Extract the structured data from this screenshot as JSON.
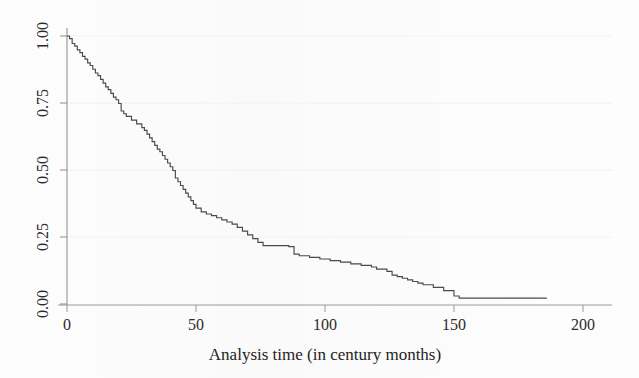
{
  "chart_data": {
    "type": "line",
    "subtype": "kaplan-meier-step",
    "title": "",
    "xlabel": "Analysis time (in century months)",
    "ylabel": "",
    "xlim": [
      -8,
      212
    ],
    "ylim": [
      0.0,
      1.0
    ],
    "xticks": [
      0,
      50,
      100,
      150,
      200
    ],
    "xticklabels": [
      "0",
      "50",
      "100",
      "150",
      "200"
    ],
    "yticks": [
      0.0,
      0.25,
      0.5,
      0.75,
      1.0
    ],
    "yticklabels": [
      "0.00",
      "0.25",
      "0.50",
      "0.75",
      "1.00"
    ],
    "grid": "faint-horizontal",
    "legend": "none",
    "line_color": "#4a4a4a",
    "series": [
      {
        "name": "Survivor function",
        "step": "post",
        "x": [
          0,
          1,
          2,
          3,
          4,
          5,
          6,
          7,
          8,
          9,
          10,
          11,
          12,
          13,
          14,
          15,
          16,
          17,
          18,
          19,
          20,
          21,
          22,
          23,
          25,
          27,
          29,
          30,
          31,
          32,
          33,
          34,
          35,
          36,
          37,
          38,
          39,
          40,
          41,
          42,
          43,
          44,
          45,
          46,
          47,
          48,
          49,
          50,
          52,
          54,
          56,
          58,
          60,
          62,
          64,
          66,
          68,
          70,
          72,
          74,
          76,
          86,
          88,
          90,
          94,
          98,
          102,
          106,
          110,
          114,
          118,
          120,
          124,
          126,
          128,
          130,
          132,
          134,
          136,
          138,
          142,
          146,
          150,
          152,
          186
        ],
        "y": [
          1.0,
          0.99,
          0.972,
          0.962,
          0.948,
          0.938,
          0.924,
          0.914,
          0.9,
          0.89,
          0.876,
          0.862,
          0.852,
          0.838,
          0.824,
          0.81,
          0.8,
          0.786,
          0.772,
          0.762,
          0.748,
          0.72,
          0.71,
          0.7,
          0.686,
          0.672,
          0.658,
          0.648,
          0.634,
          0.62,
          0.606,
          0.592,
          0.578,
          0.568,
          0.554,
          0.54,
          0.526,
          0.512,
          0.498,
          0.47,
          0.456,
          0.442,
          0.428,
          0.414,
          0.4,
          0.386,
          0.372,
          0.358,
          0.344,
          0.336,
          0.33,
          0.322,
          0.314,
          0.306,
          0.298,
          0.286,
          0.272,
          0.258,
          0.244,
          0.23,
          0.218,
          0.214,
          0.186,
          0.18,
          0.174,
          0.168,
          0.162,
          0.156,
          0.15,
          0.144,
          0.138,
          0.13,
          0.122,
          0.108,
          0.102,
          0.096,
          0.09,
          0.084,
          0.078,
          0.072,
          0.062,
          0.05,
          0.03,
          0.022,
          0.022
        ]
      }
    ]
  },
  "axes": {
    "x_title": "Analysis time (in century months)",
    "x_tick_labels": [
      "0",
      "50",
      "100",
      "150",
      "200"
    ],
    "y_tick_labels": [
      "0.00",
      "0.25",
      "0.50",
      "0.75",
      "1.00"
    ]
  }
}
